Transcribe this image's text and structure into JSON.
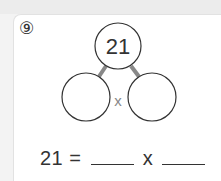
{
  "problem": {
    "number_label": "⑨",
    "top_value": "21",
    "operator": "x",
    "equation": {
      "left": "21",
      "equals": "=",
      "operator": "x"
    }
  },
  "colors": {
    "circle_stroke": "#333333",
    "connector": "#888888",
    "text": "#333333"
  }
}
